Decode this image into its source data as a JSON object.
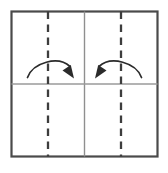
{
  "diagram": {
    "title": "Paper folding step diagram",
    "type": "origami-fold-instruction",
    "canvas": {
      "width": 168,
      "height": 173,
      "background": "#ffffff"
    },
    "sheet": {
      "name": "square-sheet",
      "x": 11.5,
      "y": 11.5,
      "width": 146,
      "height": 145,
      "stroke": "#4a4a4a",
      "stroke_width": 2.2,
      "fill": "#ffffff"
    },
    "dividers": [
      {
        "name": "vertical-center-divider",
        "orientation": "vertical",
        "x1": 84.5,
        "y1": 11.5,
        "x2": 84.5,
        "y2": 156.5,
        "stroke": "#8f8f8f",
        "stroke_width": 1.4
      },
      {
        "name": "horizontal-center-divider",
        "orientation": "horizontal",
        "x1": 11.5,
        "y1": 84.0,
        "x2": 157.5,
        "y2": 84.0,
        "stroke": "#9a9a9a",
        "stroke_width": 1.4
      }
    ],
    "fold_lines": [
      {
        "name": "left-fold-line",
        "label": "valley fold",
        "x": 48.0,
        "y1": 11.5,
        "y2": 156.5,
        "stroke": "#3d3d3d",
        "stroke_width": 2.3,
        "dash": "7.5 5.5"
      },
      {
        "name": "right-fold-line",
        "label": "valley fold",
        "x": 121.0,
        "y1": 11.5,
        "y2": 156.5,
        "stroke": "#3d3d3d",
        "stroke_width": 2.3,
        "dash": "7.5 5.5"
      }
    ],
    "arrows": [
      {
        "name": "left-fold-arrow",
        "direction": "right",
        "label": "fold left edge toward center",
        "path": "M 27.5 77.5 C 33 62.5, 58 55.5, 70 66.5",
        "stroke": "#2b2b2b",
        "stroke_width": 1.7,
        "head": "70.8,65.0 74.0,78.5 62.5,70.5",
        "head_fill": "#2b2b2b"
      },
      {
        "name": "right-fold-arrow",
        "direction": "left",
        "label": "fold right edge toward center",
        "path": "M 141.5 77.5 C 136 62.5, 111 55.5, 99 66.5",
        "stroke": "#2b2b2b",
        "stroke_width": 1.7,
        "head": "98.2,65.0 95.0,78.5 106.5,70.5",
        "head_fill": "#2b2b2b"
      }
    ]
  }
}
